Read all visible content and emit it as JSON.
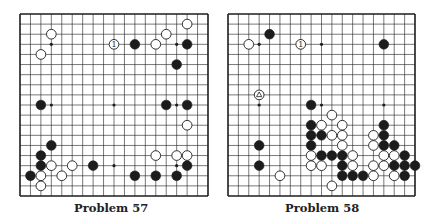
{
  "problems": [
    {
      "id": "p57",
      "caption": "Problem 57",
      "board_size": 19,
      "hoshi": [
        [
          3,
          3
        ],
        [
          9,
          3
        ],
        [
          15,
          3
        ],
        [
          3,
          9
        ],
        [
          9,
          9
        ],
        [
          15,
          9
        ],
        [
          3,
          15
        ],
        [
          9,
          15
        ],
        [
          15,
          15
        ]
      ],
      "stones": [
        {
          "c": "W",
          "col": 3,
          "row": 2
        },
        {
          "c": "W",
          "col": 2,
          "row": 4
        },
        {
          "c": "W",
          "col": 9,
          "row": 3,
          "label": "1"
        },
        {
          "c": "B",
          "col": 11,
          "row": 3
        },
        {
          "c": "W",
          "col": 13,
          "row": 3
        },
        {
          "c": "W",
          "col": 14,
          "row": 2
        },
        {
          "c": "W",
          "col": 16,
          "row": 1
        },
        {
          "c": "B",
          "col": 16,
          "row": 3
        },
        {
          "c": "B",
          "col": 15,
          "row": 5
        },
        {
          "c": "B",
          "col": 2,
          "row": 9
        },
        {
          "c": "B",
          "col": 14,
          "row": 9
        },
        {
          "c": "B",
          "col": 16,
          "row": 9
        },
        {
          "c": "W",
          "col": 16,
          "row": 11
        },
        {
          "c": "B",
          "col": 3,
          "row": 13
        },
        {
          "c": "B",
          "col": 2,
          "row": 14
        },
        {
          "c": "B",
          "col": 2,
          "row": 15
        },
        {
          "c": "W",
          "col": 3,
          "row": 15
        },
        {
          "c": "W",
          "col": 5,
          "row": 15
        },
        {
          "c": "B",
          "col": 7,
          "row": 15
        },
        {
          "c": "B",
          "col": 1,
          "row": 16
        },
        {
          "c": "W",
          "col": 2,
          "row": 16
        },
        {
          "c": "W",
          "col": 4,
          "row": 16
        },
        {
          "c": "W",
          "col": 2,
          "row": 17
        },
        {
          "c": "W",
          "col": 13,
          "row": 14
        },
        {
          "c": "W",
          "col": 15,
          "row": 14
        },
        {
          "c": "W",
          "col": 16,
          "row": 14
        },
        {
          "c": "B",
          "col": 16,
          "row": 15
        },
        {
          "c": "B",
          "col": 11,
          "row": 16
        },
        {
          "c": "B",
          "col": 13,
          "row": 16
        },
        {
          "c": "B",
          "col": 15,
          "row": 16
        }
      ]
    },
    {
      "id": "p58",
      "caption": "Problem 58",
      "board_size": 19,
      "hoshi": [
        [
          3,
          3
        ],
        [
          9,
          3
        ],
        [
          15,
          3
        ],
        [
          3,
          9
        ],
        [
          9,
          9
        ],
        [
          15,
          9
        ],
        [
          3,
          15
        ],
        [
          9,
          15
        ],
        [
          15,
          15
        ]
      ],
      "stones": [
        {
          "c": "B",
          "col": 4,
          "row": 2
        },
        {
          "c": "W",
          "col": 2,
          "row": 3
        },
        {
          "c": "W",
          "col": 7,
          "row": 3,
          "label": "1"
        },
        {
          "c": "B",
          "col": 15,
          "row": 3
        },
        {
          "c": "W",
          "col": 3,
          "row": 8,
          "label": "triangle"
        },
        {
          "c": "B",
          "col": 8,
          "row": 9
        },
        {
          "c": "W",
          "col": 10,
          "row": 10
        },
        {
          "c": "B",
          "col": 8,
          "row": 11
        },
        {
          "c": "W",
          "col": 9,
          "row": 11
        },
        {
          "c": "W",
          "col": 11,
          "row": 11
        },
        {
          "c": "B",
          "col": 15,
          "row": 11
        },
        {
          "c": "B",
          "col": 8,
          "row": 12
        },
        {
          "c": "B",
          "col": 9,
          "row": 12
        },
        {
          "c": "W",
          "col": 10,
          "row": 12
        },
        {
          "c": "W",
          "col": 11,
          "row": 12
        },
        {
          "c": "W",
          "col": 14,
          "row": 12
        },
        {
          "c": "B",
          "col": 15,
          "row": 12
        },
        {
          "c": "B",
          "col": 3,
          "row": 13
        },
        {
          "c": "B",
          "col": 8,
          "row": 13
        },
        {
          "c": "W",
          "col": 11,
          "row": 13
        },
        {
          "c": "W",
          "col": 14,
          "row": 13
        },
        {
          "c": "B",
          "col": 15,
          "row": 13
        },
        {
          "c": "B",
          "col": 16,
          "row": 13
        },
        {
          "c": "W",
          "col": 8,
          "row": 14
        },
        {
          "c": "B",
          "col": 9,
          "row": 14
        },
        {
          "c": "B",
          "col": 10,
          "row": 14
        },
        {
          "c": "B",
          "col": 11,
          "row": 14
        },
        {
          "c": "W",
          "col": 12,
          "row": 14
        },
        {
          "c": "W",
          "col": 15,
          "row": 14
        },
        {
          "c": "W",
          "col": 16,
          "row": 14
        },
        {
          "c": "B",
          "col": 17,
          "row": 14
        },
        {
          "c": "B",
          "col": 3,
          "row": 15
        },
        {
          "c": "W",
          "col": 8,
          "row": 15
        },
        {
          "c": "W",
          "col": 9,
          "row": 15
        },
        {
          "c": "B",
          "col": 11,
          "row": 15
        },
        {
          "c": "W",
          "col": 12,
          "row": 15
        },
        {
          "c": "W",
          "col": 14,
          "row": 15
        },
        {
          "c": "W",
          "col": 15,
          "row": 15
        },
        {
          "c": "B",
          "col": 16,
          "row": 15
        },
        {
          "c": "B",
          "col": 17,
          "row": 15
        },
        {
          "c": "B",
          "col": 18,
          "row": 15
        },
        {
          "c": "W",
          "col": 5,
          "row": 16
        },
        {
          "c": "B",
          "col": 11,
          "row": 16
        },
        {
          "c": "B",
          "col": 12,
          "row": 16
        },
        {
          "c": "B",
          "col": 13,
          "row": 16
        },
        {
          "c": "W",
          "col": 14,
          "row": 16
        },
        {
          "c": "W",
          "col": 16,
          "row": 16
        },
        {
          "c": "B",
          "col": 17,
          "row": 16
        },
        {
          "c": "W",
          "col": 10,
          "row": 17
        }
      ]
    }
  ],
  "colors": {
    "ink": "#1c1c1c",
    "paper": "#ffffff"
  }
}
